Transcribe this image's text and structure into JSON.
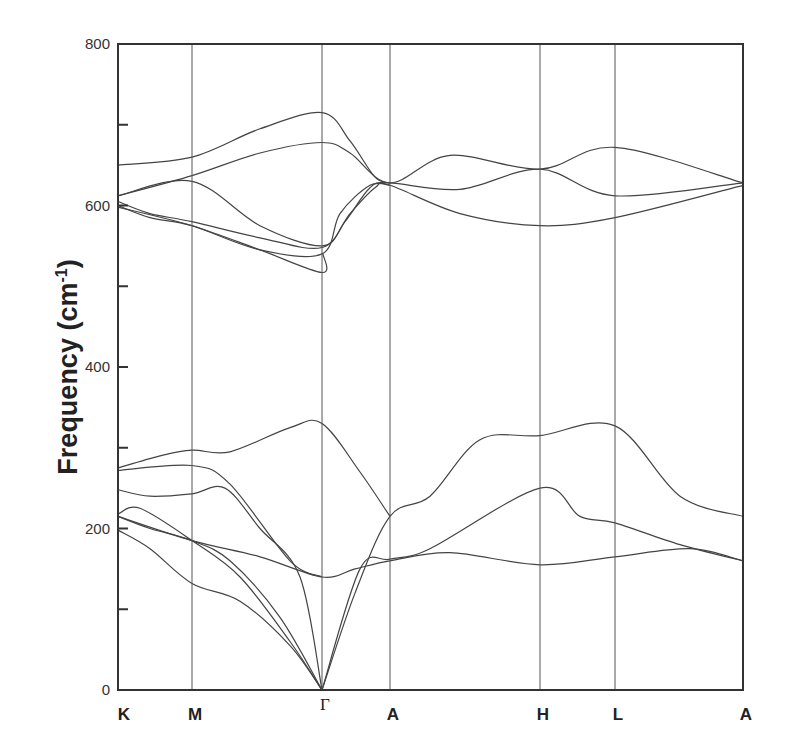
{
  "chart_data": {
    "type": "line",
    "title": "",
    "xlabel": "",
    "ylabel": "Frequency (cm-1)",
    "ylabel_main": "Frequency (cm",
    "ylabel_sup": "-1",
    "ylabel_close": ")",
    "ylim": [
      0,
      800
    ],
    "yticks": [
      0,
      200,
      400,
      600,
      800
    ],
    "yminor_ticks": [
      100,
      300,
      500,
      700
    ],
    "grid": false,
    "x_kpoints": [
      {
        "label": "K",
        "x": 118
      },
      {
        "label": "M",
        "x": 192
      },
      {
        "label": "Γ",
        "x": 322
      },
      {
        "label": "A",
        "x": 390
      },
      {
        "label": "H",
        "x": 540
      },
      {
        "label": "L",
        "x": 615
      },
      {
        "label": "A",
        "x": 743
      }
    ],
    "plot_area": {
      "left": 118,
      "right": 743,
      "top": 44,
      "bottom": 690
    },
    "series": [
      {
        "name": "acoustic-1",
        "points": [
          [
            118,
            198
          ],
          [
            150,
            175
          ],
          [
            192,
            132
          ],
          [
            240,
            110
          ],
          [
            290,
            55
          ],
          [
            322,
            0
          ]
        ]
      },
      {
        "name": "acoustic-2",
        "points": [
          [
            118,
            215
          ],
          [
            150,
            200
          ],
          [
            192,
            185
          ],
          [
            230,
            160
          ],
          [
            280,
            90
          ],
          [
            322,
            0
          ]
        ]
      },
      {
        "name": "acoustic-3",
        "points": [
          [
            118,
            218
          ],
          [
            140,
            225
          ],
          [
            192,
            185
          ],
          [
            240,
            140
          ],
          [
            290,
            60
          ],
          [
            322,
            0
          ]
        ]
      },
      {
        "name": "optic-low-1",
        "points": [
          [
            118,
            248
          ],
          [
            150,
            240
          ],
          [
            192,
            243
          ],
          [
            225,
            250
          ],
          [
            260,
            200
          ],
          [
            300,
            140
          ],
          [
            322,
            0
          ]
        ]
      },
      {
        "name": "low-2",
        "points": [
          [
            118,
            215
          ],
          [
            192,
            185
          ],
          [
            260,
            165
          ],
          [
            322,
            140
          ],
          [
            355,
            150
          ],
          [
            390,
            160
          ],
          [
            450,
            170
          ],
          [
            540,
            155
          ],
          [
            615,
            165
          ],
          [
            690,
            175
          ],
          [
            743,
            160
          ]
        ]
      },
      {
        "name": "low-3",
        "points": [
          [
            118,
            272
          ],
          [
            192,
            278
          ],
          [
            230,
            255
          ],
          [
            290,
            160
          ],
          [
            322,
            140
          ]
        ]
      },
      {
        "name": "low-rise-1",
        "points": [
          [
            322,
            0
          ],
          [
            360,
            150
          ],
          [
            390,
            162
          ],
          [
            430,
            175
          ],
          [
            540,
            250
          ],
          [
            580,
            215
          ],
          [
            615,
            207
          ],
          [
            680,
            180
          ],
          [
            743,
            160
          ]
        ]
      },
      {
        "name": "low-rise-2",
        "points": [
          [
            322,
            0
          ],
          [
            355,
            120
          ],
          [
            390,
            215
          ],
          [
            430,
            240
          ],
          [
            480,
            310
          ],
          [
            540,
            315
          ],
          [
            615,
            327
          ],
          [
            680,
            240
          ],
          [
            743,
            215
          ]
        ]
      },
      {
        "name": "low-top",
        "points": [
          [
            118,
            275
          ],
          [
            160,
            290
          ],
          [
            192,
            297
          ],
          [
            230,
            295
          ],
          [
            290,
            325
          ],
          [
            322,
            330
          ],
          [
            360,
            270
          ],
          [
            390,
            215
          ]
        ]
      },
      {
        "name": "high-1",
        "points": [
          [
            118,
            650
          ],
          [
            192,
            660
          ],
          [
            260,
            695
          ],
          [
            322,
            715
          ],
          [
            350,
            680
          ],
          [
            375,
            635
          ],
          [
            390,
            628
          ]
        ]
      },
      {
        "name": "high-2",
        "points": [
          [
            118,
            612
          ],
          [
            192,
            637
          ],
          [
            260,
            665
          ],
          [
            322,
            678
          ],
          [
            350,
            665
          ],
          [
            390,
            628
          ],
          [
            450,
            662
          ],
          [
            540,
            645
          ],
          [
            615,
            672
          ],
          [
            743,
            628
          ]
        ]
      },
      {
        "name": "high-3",
        "points": [
          [
            118,
            612
          ],
          [
            192,
            630
          ],
          [
            260,
            575
          ],
          [
            322,
            550
          ],
          [
            345,
            580
          ],
          [
            370,
            622
          ],
          [
            390,
            628
          ],
          [
            460,
            620
          ],
          [
            540,
            645
          ],
          [
            615,
            612
          ],
          [
            743,
            628
          ]
        ]
      },
      {
        "name": "high-4",
        "points": [
          [
            118,
            605
          ],
          [
            150,
            590
          ],
          [
            192,
            580
          ],
          [
            260,
            560
          ],
          [
            322,
            548
          ],
          [
            350,
            590
          ],
          [
            375,
            622
          ],
          [
            390,
            625
          ],
          [
            460,
            590
          ],
          [
            540,
            575
          ],
          [
            615,
            585
          ],
          [
            743,
            625
          ]
        ]
      },
      {
        "name": "high-5",
        "points": [
          [
            118,
            600
          ],
          [
            150,
            585
          ],
          [
            192,
            575
          ],
          [
            260,
            545
          ],
          [
            322,
            540
          ],
          [
            340,
            590
          ],
          [
            370,
            625
          ],
          [
            390,
            625
          ]
        ]
      },
      {
        "name": "high-6",
        "points": [
          [
            118,
            598
          ],
          [
            192,
            575
          ],
          [
            260,
            545
          ],
          [
            322,
            517
          ],
          [
            323,
            540
          ]
        ]
      }
    ]
  }
}
